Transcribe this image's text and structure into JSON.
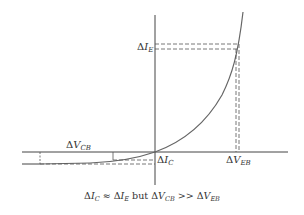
{
  "diagram": {
    "type": "transistor-characteristic",
    "colors": {
      "line": "#444444",
      "curve": "#666666",
      "dashed": "#555555",
      "text": "#333333"
    },
    "labels": {
      "delta_ie": {
        "delta": "Δ",
        "var": "I",
        "sub": "E"
      },
      "delta_vcb": {
        "delta": "Δ",
        "var": "V",
        "sub": "CB"
      },
      "delta_ic": {
        "delta": "Δ",
        "var": "I",
        "sub": "C"
      },
      "delta_veb": {
        "delta": "Δ",
        "var": "V",
        "sub": "EB"
      }
    },
    "caption": {
      "p1_delta": "Δ",
      "p1_var": "I",
      "p1_sub": "C",
      "approx": " ≈ ",
      "p2_delta": "Δ",
      "p2_var": "I",
      "p2_sub": "E",
      "but": " but ",
      "p3_delta": "Δ",
      "p3_var": "V",
      "p3_sub": "CB",
      "gg": " >> ",
      "p4_delta": "Δ",
      "p4_var": "V",
      "p4_sub": "EB"
    }
  }
}
